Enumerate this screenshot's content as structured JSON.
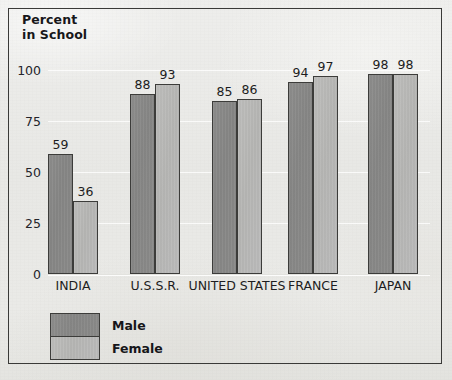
{
  "chart_data": {
    "type": "bar",
    "title": "Percent\nin School",
    "xlabel": "",
    "ylabel": "Percent in School",
    "ylim": [
      0,
      100
    ],
    "yticks": [
      0,
      25,
      50,
      75,
      100
    ],
    "ytick_labels": [
      "0",
      "25",
      "50",
      "75",
      "100"
    ],
    "grid": true,
    "legend_position": "bottom-left",
    "categories": [
      "INDIA",
      "U.S.S.R.",
      "UNITED STATES",
      "FRANCE",
      "JAPAN"
    ],
    "series": [
      {
        "name": "Male",
        "values": [
          59,
          88,
          85,
          94,
          98
        ],
        "color": "#8a8a89"
      },
      {
        "name": "Female",
        "values": [
          36,
          93,
          86,
          97,
          98
        ],
        "color": "#b9b9b7"
      }
    ],
    "data_labels": [
      {
        "category": "INDIA",
        "male": "59",
        "female": "36"
      },
      {
        "category": "U.S.S.R.",
        "male": "88",
        "female": "93"
      },
      {
        "category": "UNITED STATES",
        "male": "85",
        "female": "86"
      },
      {
        "category": "FRANCE",
        "male": "94",
        "female": "97"
      },
      {
        "category": "JAPAN",
        "male": "98",
        "female": "98"
      }
    ]
  },
  "legend": {
    "male_label": "Male",
    "female_label": "Female"
  },
  "colors": {
    "background": "#e9e9e7",
    "frame": "#3a3a38",
    "bar_outline": "#3c3c3a",
    "male_fill": "#8a8a89",
    "female_fill": "#b9b9b7",
    "gridline": "#ffffff",
    "text": "#1d1d21"
  }
}
